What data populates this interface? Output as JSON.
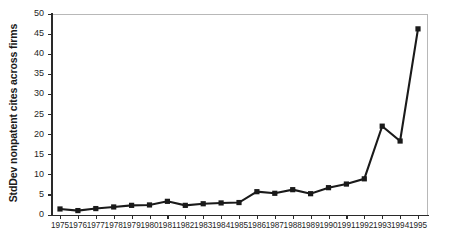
{
  "chart_data": {
    "type": "line",
    "title": "",
    "subtitle": "",
    "xlabel": "",
    "ylabel": "StdDev nonpatent cites across firms",
    "categories": [
      "1975",
      "1976",
      "1977",
      "1978",
      "1979",
      "1980",
      "1981",
      "1982",
      "1983",
      "1984",
      "1985",
      "1986",
      "1987",
      "1988",
      "1989",
      "1990",
      "1991",
      "1992",
      "1993",
      "1994",
      "1995"
    ],
    "x": [
      1975,
      1976,
      1977,
      1978,
      1979,
      1980,
      1981,
      1982,
      1983,
      1984,
      1985,
      1986,
      1987,
      1988,
      1989,
      1990,
      1991,
      1992,
      1993,
      1994,
      1995
    ],
    "values": [
      1.5,
      1.1,
      1.6,
      2.0,
      2.4,
      2.5,
      3.4,
      2.4,
      2.8,
      3.0,
      3.1,
      5.8,
      5.4,
      6.3,
      5.3,
      6.8,
      7.7,
      9.0,
      22.1,
      18.4,
      46.3
    ],
    "series": [
      {
        "name": "StdDev nonpatent cites across firms",
        "values": [
          1.5,
          1.1,
          1.6,
          2.0,
          2.4,
          2.5,
          3.4,
          2.4,
          2.8,
          3.0,
          3.1,
          5.8,
          5.4,
          6.3,
          5.3,
          6.8,
          7.7,
          9.0,
          22.1,
          18.4,
          46.3
        ]
      }
    ],
    "ylim": [
      0,
      50
    ],
    "xlim": [
      1975,
      1995
    ],
    "yticks": [
      0,
      5,
      10,
      15,
      20,
      25,
      30,
      35,
      40,
      45,
      50
    ],
    "ytick_labels": [
      "0",
      "5",
      "10",
      "15",
      "20",
      "25",
      "30",
      "35",
      "40",
      "45",
      "50"
    ],
    "grid": false,
    "legend": false,
    "legend_position": "none",
    "marker": "square",
    "line_color": "#1a1a1a",
    "marker_color": "#1a1a1a",
    "background_color": "#ffffff",
    "frame_color": "#b8b8b8"
  },
  "axes": {
    "y_title": "StdDev nonpatent cites across firms",
    "y_tick_labels": [
      "50",
      "45",
      "40",
      "35",
      "30",
      "25",
      "20",
      "15",
      "10",
      "5",
      "0"
    ],
    "x_tick_labels": [
      "1975",
      "1976",
      "1977",
      "1978",
      "1979",
      "1980",
      "1981",
      "1982",
      "1983",
      "1984",
      "1985",
      "1986",
      "1987",
      "1988",
      "1989",
      "1990",
      "1991",
      "1992",
      "1993",
      "1994",
      "1995"
    ]
  }
}
